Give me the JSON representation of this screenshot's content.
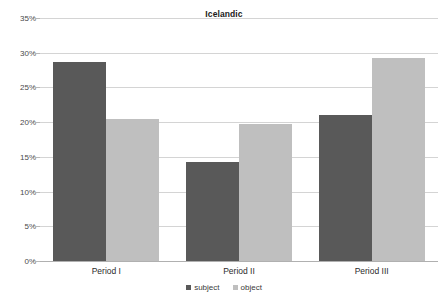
{
  "chart_data": {
    "type": "bar",
    "title": "Icelandic",
    "xlabel": "",
    "ylabel": "",
    "categories": [
      "Period I",
      "Period II",
      "Period III"
    ],
    "series": [
      {
        "name": "subject",
        "color": "#595959",
        "values": [
          28.7,
          14.3,
          21.0
        ]
      },
      {
        "name": "object",
        "color": "#bfbfbf",
        "values": [
          20.4,
          19.8,
          29.3
        ]
      }
    ],
    "ylim": [
      0,
      35
    ],
    "ytick_values": [
      0,
      5,
      10,
      15,
      20,
      25,
      30,
      35
    ],
    "ytick_labels": [
      "0%",
      "5%",
      "10%",
      "15%",
      "20%",
      "25%",
      "30%",
      "35%"
    ],
    "grid": true,
    "legend_position": "bottom",
    "value_format": "percent"
  }
}
